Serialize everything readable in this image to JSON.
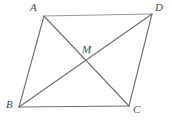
{
  "figure": {
    "background_color": "#ffffff",
    "stroke_color": "#6e6e6e",
    "stroke_color_light": "#9a9a9a",
    "label_color": "#4a4a4a",
    "stroke_width": 1,
    "width": 172,
    "height": 128,
    "labels": {
      "a": "A",
      "b": "B",
      "c": "C",
      "d": "D",
      "m": "M"
    },
    "points": {
      "A": {
        "x": 44,
        "y": 16
      },
      "D": {
        "x": 152,
        "y": 14
      },
      "B": {
        "x": 19,
        "y": 107
      },
      "C": {
        "x": 129,
        "y": 106
      },
      "M": {
        "x": 86,
        "y": 60
      }
    },
    "segments": [
      {
        "name": "side-AD",
        "from": "A",
        "to": "D"
      },
      {
        "name": "side-DC",
        "from": "D",
        "to": "C"
      },
      {
        "name": "side-CB",
        "from": "C",
        "to": "B"
      },
      {
        "name": "side-BA",
        "from": "B",
        "to": "A"
      },
      {
        "name": "diagonal-AC",
        "from": "A",
        "to": "C"
      },
      {
        "name": "diagonal-BD",
        "from": "B",
        "to": "D"
      }
    ]
  }
}
